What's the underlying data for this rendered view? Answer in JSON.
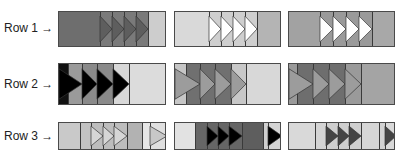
{
  "rows": [
    {
      "label": "Row 1 →",
      "label_y": 21,
      "top": 11,
      "height": 36,
      "blocks": [
        {
          "left": 58,
          "width": 108,
          "segments": [
            {
              "w": 41,
              "fill": "#6e6e6e"
            },
            {
              "w": 12,
              "fill": "#7a7a7a",
              "tri": "#5e5e5e"
            },
            {
              "w": 12,
              "fill": "#7a7a7a",
              "tri": "#5e5e5e"
            },
            {
              "w": 12,
              "fill": "#7a7a7a",
              "tri": "#5e5e5e"
            },
            {
              "w": 12,
              "fill": "#7a7a7a",
              "tri": "#5e5e5e"
            },
            {
              "w": 19,
              "fill": "#cdcdcd"
            }
          ]
        },
        {
          "left": 174,
          "width": 107,
          "segments": [
            {
              "w": 34,
              "fill": "#d9d9d9"
            },
            {
              "w": 12,
              "fill": "#cfcfcf",
              "tri": "#ffffff"
            },
            {
              "w": 12,
              "fill": "#cfcfcf",
              "tri": "#ffffff"
            },
            {
              "w": 12,
              "fill": "#cfcfcf",
              "tri": "#ffffff"
            },
            {
              "w": 12,
              "fill": "#cfcfcf",
              "tri": "#ffffff"
            },
            {
              "w": 25,
              "fill": "#b4b4b4"
            }
          ]
        },
        {
          "left": 288,
          "width": 107,
          "segments": [
            {
              "w": 31,
              "fill": "#a2a2a2"
            },
            {
              "w": 13,
              "fill": "#9a9a9a",
              "tri": "#ffffff"
            },
            {
              "w": 13,
              "fill": "#9a9a9a",
              "tri": "#ffffff"
            },
            {
              "w": 13,
              "fill": "#9a9a9a",
              "tri": "#ffffff"
            },
            {
              "w": 13,
              "fill": "#9a9a9a",
              "tri": "#ffffff"
            },
            {
              "w": 24,
              "fill": "#a8a8a8"
            }
          ]
        }
      ]
    },
    {
      "label": "Row 2 →",
      "label_y": 77,
      "top": 63,
      "height": 42,
      "blocks": [
        {
          "left": 58,
          "width": 108,
          "segments": [
            {
              "w": 9,
              "fill": "#111111"
            },
            {
              "w": 14,
              "fill": "#9a9a9a",
              "tri": "#000000",
              "span_prev": 9
            },
            {
              "w": 15,
              "fill": "#8a8a8a",
              "tri": "#000000"
            },
            {
              "w": 16,
              "fill": "#8a8a8a",
              "tri": "#000000"
            },
            {
              "w": 16,
              "fill": "#d8d8d8",
              "tri": "#000000"
            },
            {
              "w": 38,
              "fill": "#dcdcdc"
            }
          ]
        },
        {
          "left": 174,
          "width": 107,
          "segments": [
            {
              "w": 11,
              "fill": "#c6c6c6"
            },
            {
              "w": 14,
              "fill": "#707070",
              "tri": "#9c9c9c",
              "span_prev": 11
            },
            {
              "w": 15,
              "fill": "#707070",
              "tri": "#9c9c9c"
            },
            {
              "w": 16,
              "fill": "#707070",
              "tri": "#9c9c9c"
            },
            {
              "w": 15,
              "fill": "#c8c8c8",
              "tri": "#9c9c9c"
            },
            {
              "w": 36,
              "fill": "#d8d8d8"
            }
          ]
        },
        {
          "left": 288,
          "width": 107,
          "segments": [
            {
              "w": 8,
              "fill": "#9a9a9a"
            },
            {
              "w": 16,
              "fill": "#6e6e6e",
              "tri": "#9c9c9c",
              "span_prev": 8
            },
            {
              "w": 16,
              "fill": "#6e6e6e",
              "tri": "#9c9c9c"
            },
            {
              "w": 16,
              "fill": "#6e6e6e",
              "tri": "#9c9c9c"
            },
            {
              "w": 16,
              "fill": "#9a9a9a",
              "tri": "#9c9c9c"
            },
            {
              "w": 35,
              "fill": "#a4a4a4"
            }
          ]
        }
      ]
    },
    {
      "label": "Row 3 →",
      "label_y": 129,
      "top": 122,
      "height": 28,
      "blocks": [
        {
          "left": 58,
          "width": 108,
          "segments": [
            {
              "w": 21,
              "fill": "#c9c9c9"
            },
            {
              "w": 11,
              "fill": "#c2c2c2"
            },
            {
              "w": 12,
              "fill": "#bdbdbd",
              "tri": "#d6d6d6"
            },
            {
              "w": 11,
              "fill": "#bdbdbd",
              "tri": "#d6d6d6"
            },
            {
              "w": 13,
              "fill": "#bdbdbd",
              "tri": "#d6d6d6"
            },
            {
              "w": 15,
              "fill": "#b2b2b2"
            },
            {
              "w": 8,
              "fill": "#e6e6e6"
            },
            {
              "w": 17,
              "fill": "#e0e0e0",
              "tri": "#c8c8c8"
            }
          ]
        },
        {
          "left": 174,
          "width": 107,
          "segments": [
            {
              "w": 20,
              "fill": "#e2e2e2"
            },
            {
              "w": 12,
              "fill": "#666666"
            },
            {
              "w": 11,
              "fill": "#666666",
              "tri": "#000000"
            },
            {
              "w": 11,
              "fill": "#666666",
              "tri": "#000000"
            },
            {
              "w": 13,
              "fill": "#666666",
              "tri": "#000000"
            },
            {
              "w": 21,
              "fill": "#5e5e5e"
            },
            {
              "w": 5,
              "fill": "#cfcfcf"
            },
            {
              "w": 14,
              "fill": "#d4d4d4",
              "tri": "#000000"
            }
          ]
        },
        {
          "left": 288,
          "width": 107,
          "segments": [
            {
              "w": 26,
              "fill": "#d9d9d9"
            },
            {
              "w": 11,
              "fill": "#d4d4d4"
            },
            {
              "w": 12,
              "fill": "#cfcfcf",
              "tri": "#444444"
            },
            {
              "w": 11,
              "fill": "#cfcfcf",
              "tri": "#444444"
            },
            {
              "w": 12,
              "fill": "#cfcfcf",
              "tri": "#444444"
            },
            {
              "w": 18,
              "fill": "#d6d6d6"
            },
            {
              "w": 6,
              "fill": "#d2d2d2"
            },
            {
              "w": 11,
              "fill": "#d9d9d9",
              "tri": "#444444"
            }
          ]
        }
      ]
    }
  ]
}
